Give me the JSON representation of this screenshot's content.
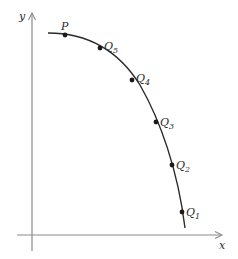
{
  "diagram": {
    "axes": {
      "x_label": "x",
      "y_label": "y",
      "axis_color": "#8a8a8a"
    },
    "curve": {
      "color": "#2a2a2a",
      "path": "M48,33 C80,33 115,45 140,85 C160,120 178,170 185,228"
    },
    "points": [
      {
        "name": "P",
        "label": "P",
        "sub": "",
        "x": 65,
        "y": 35,
        "lx": 61,
        "ly": 30
      },
      {
        "name": "Q5",
        "label": "Q",
        "sub": "5",
        "x": 100,
        "y": 48,
        "lx": 104,
        "ly": 50
      },
      {
        "name": "Q4",
        "label": "Q",
        "sub": "4",
        "x": 132,
        "y": 80,
        "lx": 136,
        "ly": 82
      },
      {
        "name": "Q3",
        "label": "Q",
        "sub": "3",
        "x": 156,
        "y": 122,
        "lx": 160,
        "ly": 126
      },
      {
        "name": "Q2",
        "label": "Q",
        "sub": "2",
        "x": 172,
        "y": 165,
        "lx": 176,
        "ly": 169
      },
      {
        "name": "Q1",
        "label": "Q",
        "sub": "1",
        "x": 182,
        "y": 212,
        "lx": 186,
        "ly": 216
      }
    ],
    "point_color": "#1a1a1a"
  }
}
